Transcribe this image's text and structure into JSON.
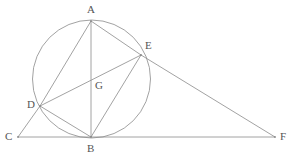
{
  "figure": {
    "stroke_color": "#8a8a8a",
    "label_color": "#555555",
    "background_color": "#ffffff",
    "width": 294,
    "height": 159,
    "points": [
      {
        "id": "A",
        "label": "A",
        "x": 91,
        "y": 21,
        "label_x": 87,
        "label_y": 4,
        "on_circle": true
      },
      {
        "id": "E",
        "label": "E",
        "x": 141,
        "y": 55,
        "label_x": 145,
        "label_y": 40,
        "on_circle": true
      },
      {
        "id": "G",
        "label": "G",
        "x": 93,
        "y": 86,
        "label_x": 95,
        "label_y": 80,
        "on_circle": false
      },
      {
        "id": "D",
        "label": "D",
        "x": 40,
        "y": 106,
        "label_x": 27,
        "label_y": 99,
        "on_circle": true
      },
      {
        "id": "C",
        "label": "C",
        "x": 18,
        "y": 137,
        "label_x": 5,
        "label_y": 131,
        "on_circle": false
      },
      {
        "id": "B",
        "label": "B",
        "x": 91,
        "y": 137,
        "label_x": 87,
        "label_y": 143,
        "on_circle": true
      },
      {
        "id": "F",
        "label": "F",
        "x": 275,
        "y": 137,
        "label_x": 280,
        "label_y": 131,
        "on_circle": false
      }
    ],
    "circle": {
      "cx": 91.5,
      "cy": 79,
      "r": 59
    },
    "segments": [
      {
        "name": "segment-A-B",
        "from": "A",
        "to": "B"
      },
      {
        "name": "segment-A-D",
        "from": "A",
        "to": "D"
      },
      {
        "name": "segment-A-E",
        "from": "A",
        "to": "E"
      },
      {
        "name": "segment-D-E",
        "from": "D",
        "to": "E"
      },
      {
        "name": "segment-D-B",
        "from": "D",
        "to": "B"
      },
      {
        "name": "segment-E-B",
        "from": "E",
        "to": "B"
      },
      {
        "name": "segment-C-D",
        "from": "C",
        "to": "D"
      },
      {
        "name": "segment-C-F",
        "from": "C",
        "to": "F"
      },
      {
        "name": "segment-E-F",
        "from": "E",
        "to": "F"
      }
    ]
  }
}
